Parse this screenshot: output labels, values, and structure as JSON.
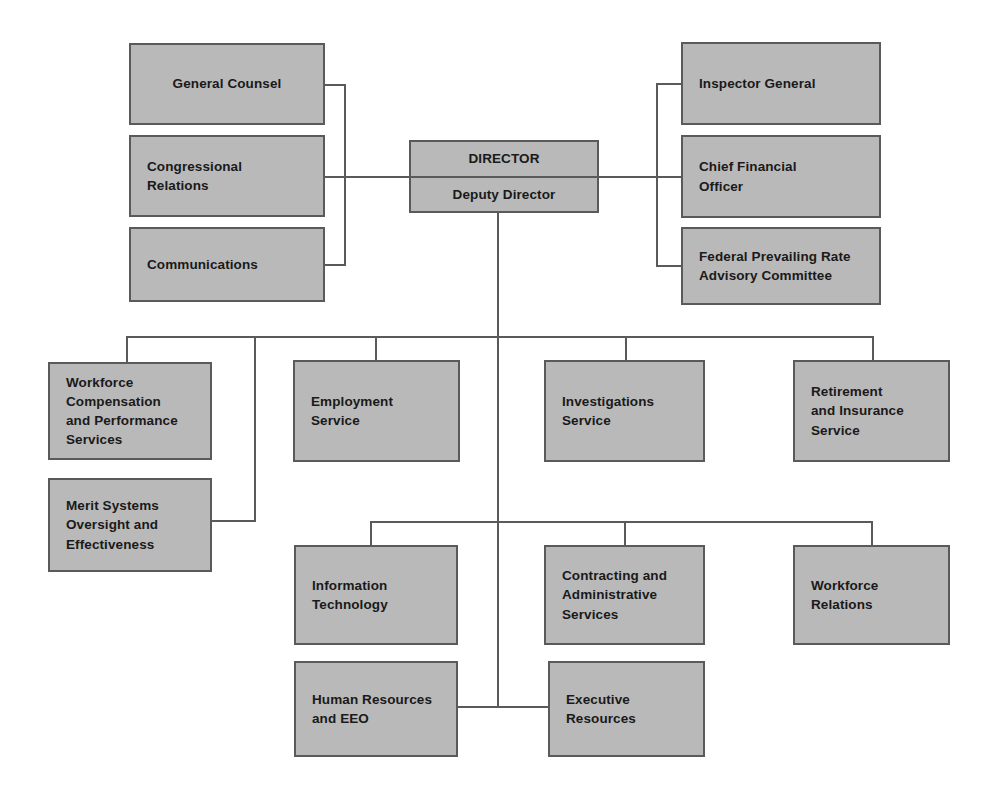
{
  "diagram": {
    "type": "org-chart",
    "colors": {
      "box_fill": "#b9b9b9",
      "box_border": "#5a5a5a",
      "line": "#5a5a5a",
      "text": "#1a1a1a",
      "background": "#ffffff"
    }
  },
  "nodes": {
    "director": {
      "top_label": "DIRECTOR",
      "bottom_label": "Deputy Director"
    },
    "left_staff": [
      {
        "label": "General Counsel"
      },
      {
        "label": "Congressional\nRelations"
      },
      {
        "label": "Communications"
      }
    ],
    "right_staff": [
      {
        "label": "Inspector General"
      },
      {
        "label": "Chief Financial\nOfficer"
      },
      {
        "label": "Federal Prevailing Rate\nAdvisory  Committee"
      }
    ],
    "programs_row": [
      {
        "label": "Workforce\nCompensation\nand Performance\nServices"
      },
      {
        "label": "Employment\nService"
      },
      {
        "label": "Investigations\nService"
      },
      {
        "label": "Retirement\nand Insurance\nService"
      }
    ],
    "merit": {
      "label": "Merit Systems\nOversight and\nEffectiveness"
    },
    "support_row": [
      {
        "label": "Information\nTechnology"
      },
      {
        "label": "Contracting and\nAdministrative\nServices"
      },
      {
        "label": "Workforce\nRelations"
      }
    ],
    "bottom_row": [
      {
        "label": "Human Resources\nand EEO"
      },
      {
        "label": "Executive\nResources"
      }
    ]
  }
}
